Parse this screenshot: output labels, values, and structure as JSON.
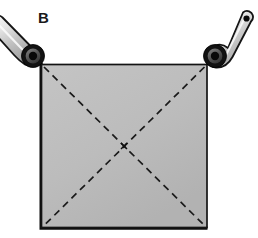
{
  "figure": {
    "panel_label": "B",
    "width": 258,
    "height": 238,
    "background_color": "#ffffff"
  },
  "colors": {
    "plate_fill": "#bcbcbc",
    "plate_fill_light": "#c6c6c6",
    "plate_edge_dark": "#141414",
    "plate_edge_shadow": "#0d0d0d",
    "diagonal_dash": "#1a1a1a",
    "arm_outline": "#151515",
    "arm_fill_light": "#f2f2f2",
    "arm_fill_mid": "#c9c9c9",
    "arm_fill_dark": "#9a9a9a",
    "hub_ring": "#121212",
    "hub_mid": "#5e5e5e",
    "hub_core": "#080808",
    "pin_color": "#0a0a0a",
    "label_color": "#1a1a1a"
  },
  "plate": {
    "name": "square-plate",
    "x": 41,
    "y": 64,
    "width": 166,
    "height": 164,
    "fill": "#bcbcbc",
    "edge_thickness_left": 3,
    "edge_thickness_bottom": 3,
    "edge_thickness_top": 1.6,
    "edge_thickness_right": 1.6,
    "corners": {
      "top_left": [
        41,
        64
      ],
      "top_right": [
        207,
        64
      ],
      "bottom_right": [
        207,
        228
      ],
      "bottom_left": [
        41,
        228
      ]
    }
  },
  "diagonals": {
    "name": "dashed-diagonals",
    "dash_pattern": "7 5",
    "stroke_width": 1.6,
    "lines": [
      {
        "name": "diagonal-tl-br",
        "x1": 43,
        "y1": 66,
        "x2": 205,
        "y2": 226
      },
      {
        "name": "diagonal-tr-bl",
        "x1": 205,
        "y1": 66,
        "x2": 43,
        "y2": 226
      }
    ],
    "center_marker": {
      "x": 124,
      "y": 146,
      "size": 5
    }
  },
  "linkages": [
    {
      "name": "left-linkage-arm",
      "pivot": {
        "x": 33,
        "y": 56,
        "outer_radius": 11.5,
        "mid_radius": 7.5,
        "core_radius": 4.2
      },
      "tip": {
        "x": -4,
        "y": 22,
        "radius": 5.5
      },
      "taper_start_half_width": 7.5,
      "taper_end_half_width": 4.5,
      "attached_corner": "top_left"
    },
    {
      "name": "right-linkage-arm",
      "pivot": {
        "x": 215,
        "y": 56,
        "outer_radius": 11.5,
        "mid_radius": 7.5,
        "core_radius": 4.2
      },
      "tip": {
        "x": 246,
        "y": 19,
        "radius": 6.5
      },
      "tip_pin_radius": 3.0,
      "taper_start_half_width": 8.5,
      "taper_end_half_width": 5.0,
      "attached_corner": "top_right"
    }
  ]
}
